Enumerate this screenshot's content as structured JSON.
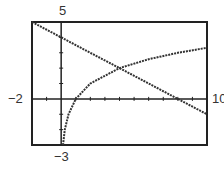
{
  "chart_data": {
    "type": "line",
    "title": "",
    "xlabel": "",
    "ylabel": "",
    "xlim": [
      -2,
      10
    ],
    "ylim": [
      -3,
      5
    ],
    "grid": false,
    "legend": null,
    "tick_labels": {
      "ymax": "5",
      "ymin": "−3",
      "xmin": "−2",
      "xmax": "10"
    },
    "x_ticks": [
      -1,
      0,
      1,
      2,
      3,
      4,
      5,
      6,
      7,
      8,
      9
    ],
    "y_ticks": [
      -2,
      -1,
      0,
      1,
      2,
      3,
      4
    ],
    "series": [
      {
        "name": "decreasing line (estimated from pixels)",
        "style": "dotted",
        "x": [
          -2,
          0,
          2,
          4,
          6,
          8,
          10
        ],
        "y": [
          5,
          4,
          3,
          2,
          1,
          0,
          -1
        ]
      },
      {
        "name": "logarithmic curve (estimated from pixels)",
        "style": "dotted",
        "x": [
          0.125,
          0.25,
          0.5,
          1,
          2,
          4,
          6,
          8,
          10
        ],
        "y": [
          -3,
          -2,
          -1,
          0,
          1,
          2,
          2.58,
          3,
          3.32
        ]
      }
    ],
    "annotations": [
      {
        "label": "intersection (estimated)",
        "x": 4,
        "y": 2
      }
    ]
  },
  "screen": {
    "frame_color": "#222222",
    "curve_color": "#333333",
    "background": "#ffffff"
  }
}
